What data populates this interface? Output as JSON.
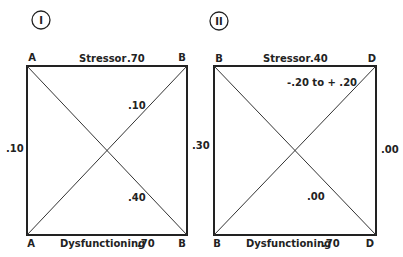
{
  "diagrams": [
    {
      "id": "I",
      "roman_label": "I",
      "corners": {
        "top_left": "A",
        "top_right": "B",
        "bottom_left": "A",
        "bottom_right": "B"
      },
      "top_edge": {
        "name": "Stressor",
        "value": ".70"
      },
      "bottom_edge": {
        "name": "Dysfunctioning",
        "value": ".70"
      },
      "left_edge_value": ".10",
      "right_edge_value": ".30",
      "diagonal_upper_value": ".10",
      "diagonal_lower_value": ".40"
    },
    {
      "id": "II",
      "roman_label": "II",
      "corners": {
        "top_left": "B",
        "top_right": "D",
        "bottom_left": "B",
        "bottom_right": "D"
      },
      "top_edge": {
        "name": "Stressor",
        "value": ".40"
      },
      "bottom_edge": {
        "name": "Dysfunctioning",
        "value": ".70"
      },
      "left_edge_value": "",
      "right_edge_value": ".00",
      "diagonal_upper_value": "-.20 to + .20",
      "diagonal_lower_value": ".00"
    }
  ],
  "colors": {
    "line": "#222222",
    "background": "#ffffff"
  }
}
